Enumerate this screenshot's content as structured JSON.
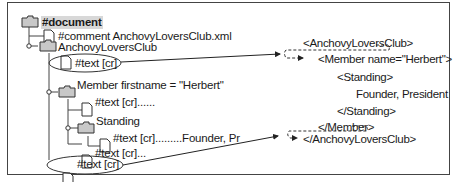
{
  "tree": {
    "nodes": [
      {
        "label": "#document",
        "icon": "folder-icon",
        "level": 0
      },
      {
        "label": "#comment  AnchovyLoversClub.xml",
        "icon": "file-icon",
        "level": 1
      },
      {
        "label": "AnchovyLoversClub",
        "icon": "folder-icon",
        "level": 1
      },
      {
        "label": "#text  [cr]",
        "icon": "file-icon",
        "level": 2,
        "circled": true
      },
      {
        "label": "Member firstname = \"Herbert\"",
        "icon": "folder-icon",
        "level": 2
      },
      {
        "label": "#text  [cr]......",
        "icon": "file-icon",
        "level": 3
      },
      {
        "label": "Standing",
        "icon": "folder-icon",
        "level": 3
      },
      {
        "label": "#text  [cr].........Founder, Pr",
        "icon": "file-icon",
        "level": 4
      },
      {
        "label": "#text  [cr]...",
        "icon": "file-icon",
        "level": 3
      },
      {
        "label": "#text  [cr]",
        "icon": "file-icon",
        "level": 2,
        "circled": true
      }
    ]
  },
  "xml": {
    "lines": [
      "<AnchovyLoversClub>",
      "<Member name=\"Herbert\">",
      "<Standing>",
      "Founder, President",
      "</Standing>",
      "</Member>",
      "</AnchovyLoversClub>"
    ]
  },
  "colors": {
    "folder_fill": "#c8c8c8",
    "line": "#333333",
    "highlight": "#d8d8d8"
  }
}
